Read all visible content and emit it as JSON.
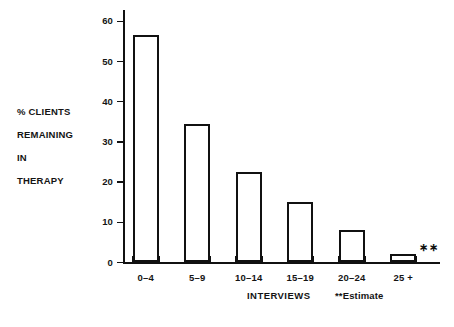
{
  "chart_data": {
    "type": "bar",
    "title": "",
    "subtitle": "",
    "categories": [
      "0–4",
      "5–9",
      "10–14",
      "15–19",
      "20–24",
      "25 +"
    ],
    "values": [
      56.7,
      34.5,
      22.6,
      15.0,
      8.2,
      2.0
    ],
    "xlabel": "INTERVIEWS",
    "ylabel": "% CLIENTS REMAINING IN THERAPY",
    "ylim": [
      0,
      63
    ],
    "yticks": [
      0,
      10,
      20,
      30,
      40,
      50,
      60
    ],
    "ytick_labels": [
      "0",
      "10",
      "20",
      "30",
      "40",
      "50",
      "60"
    ],
    "grid": false,
    "legend": null,
    "annotations": [
      {
        "text": "**",
        "category": "25 +",
        "meaning": "Estimate"
      }
    ],
    "footnote": "**Estimate",
    "bar_style": {
      "fill": "#ffffff",
      "edge": "#111111"
    }
  },
  "axis": {
    "y_title_lines": [
      "% CLIENTS",
      "REMAINING",
      "IN",
      "THERAPY"
    ],
    "x_title": "INTERVIEWS"
  },
  "notes": {
    "estimate": "**Estimate",
    "estimate_marker": "∗∗"
  },
  "colors": {
    "ink": "#111111",
    "paper": "#ffffff"
  }
}
